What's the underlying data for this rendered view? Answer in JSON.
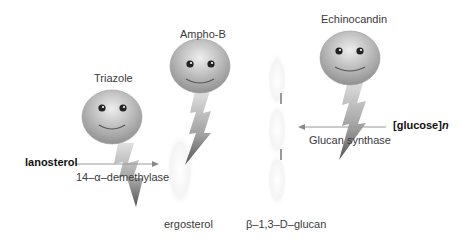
{
  "diagram": {
    "drugs": [
      {
        "name": "Triazole",
        "target": "14-α-demethylase"
      },
      {
        "name": "Ampho-B",
        "target": "ergosterol"
      },
      {
        "name": "Echinocandin",
        "target": "Glucan synthase"
      }
    ],
    "labels": {
      "triazole": "Triazole",
      "ampho_b": "Ampho-B",
      "echinocandin": "Echinocandin",
      "lanosterol": "lanosterol",
      "demethylase": "14–α–demethylase",
      "ergosterol": "ergosterol",
      "glucose_n_prefix": "[glucose]",
      "glucose_n_suffix": "n",
      "glucan_synthase": "Glucan synthase",
      "beta_glucan": "β–1,3–D–glucan"
    },
    "colors": {
      "face_dark": "#8a8a8a",
      "face_light": "#e6e6e6",
      "arrow": "#999999",
      "text": "#3a3a3a"
    }
  }
}
